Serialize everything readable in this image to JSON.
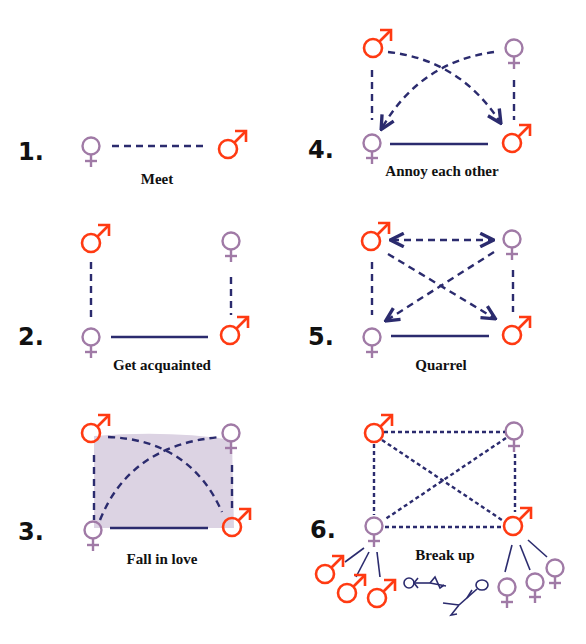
{
  "colors": {
    "female_symbol": "#a07aa6",
    "male_symbol": "#ff3a12",
    "lines": "#2b2b6e",
    "love_fill": "#dcd3e3",
    "text": "#111111"
  },
  "legend": {
    "female_icon": "venus-symbol",
    "male_icon": "mars-symbol",
    "dashed_line": "developing relationship",
    "solid_line": "relationship",
    "dotted_line": "broken relationship"
  },
  "stages": [
    {
      "number": "1.",
      "caption": "Meet"
    },
    {
      "number": "2.",
      "caption": "Get acquainted"
    },
    {
      "number": "3.",
      "caption": "Fall in love"
    },
    {
      "number": "4.",
      "caption": "Annoy each other"
    },
    {
      "number": "5.",
      "caption": "Quarrel"
    },
    {
      "number": "6.",
      "caption": "Break up"
    }
  ]
}
